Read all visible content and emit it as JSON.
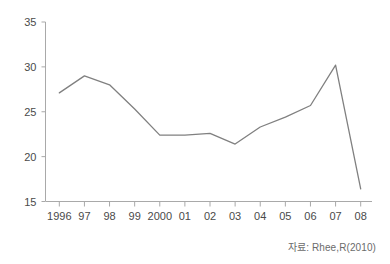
{
  "chart_data": {
    "type": "line",
    "title": "",
    "subtitle": "",
    "xlabel": "",
    "ylabel": "",
    "categories": [
      "1996",
      "97",
      "98",
      "99",
      "2000",
      "01",
      "02",
      "03",
      "04",
      "05",
      "06",
      "07",
      "08"
    ],
    "values": [
      27.1,
      29.0,
      28.0,
      25.3,
      22.4,
      22.4,
      22.6,
      21.4,
      23.3,
      24.4,
      25.7,
      30.2,
      16.4
    ],
    "series": [
      {
        "name": "series-1",
        "values": [
          27.1,
          29.0,
          28.0,
          25.3,
          22.4,
          22.4,
          22.6,
          21.4,
          23.3,
          24.4,
          25.7,
          30.2,
          16.4
        ],
        "color": "#808080"
      }
    ],
    "ylim": [
      15,
      35
    ],
    "yticks": [
      15,
      20,
      25,
      30,
      35
    ],
    "ytick_labels": [
      "15",
      "20",
      "25",
      "30",
      "35"
    ],
    "xtick_labels": [
      "1996",
      "97",
      "98",
      "99",
      "2000",
      "01",
      "02",
      "03",
      "04",
      "05",
      "06",
      "07",
      "08"
    ],
    "grid": false,
    "legend": false,
    "legend_position": "none",
    "markers": false,
    "line_color": "#808080",
    "axis_color": "#a9a9a9",
    "annotations": []
  },
  "source": {
    "text": "자료: Rhee,R(2010)"
  }
}
